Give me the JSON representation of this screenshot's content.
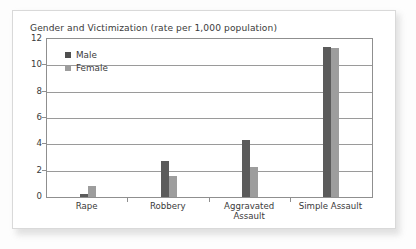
{
  "chart_data": {
    "type": "bar",
    "title": "Gender and Victimization (rate per 1,000 population)",
    "xlabel": "",
    "ylabel": "",
    "ylim": [
      0,
      12
    ],
    "yticks": [
      0,
      2,
      4,
      6,
      8,
      10,
      12
    ],
    "ytick_labels": [
      "0",
      "2",
      "4",
      "6",
      "8",
      "10",
      "12"
    ],
    "grid": true,
    "legend_position": "top-left",
    "categories": [
      "Rape",
      "Robbery",
      "Aggravated Assault",
      "Simple Assault"
    ],
    "category_lines": [
      [
        "Rape"
      ],
      [
        "Robbery"
      ],
      [
        "Aggravated",
        "Assault"
      ],
      [
        "Simple Assault"
      ]
    ],
    "series": [
      {
        "name": "Male",
        "color": "#5b5b5b",
        "values": [
          0.2,
          2.7,
          4.3,
          11.4
        ]
      },
      {
        "name": "Female",
        "color": "#9d9d9d",
        "values": [
          0.8,
          1.6,
          2.3,
          11.3
        ]
      }
    ]
  },
  "legend": {
    "items": [
      {
        "label": "Male",
        "swatch": "male-swatch"
      },
      {
        "label": "Female",
        "swatch": "female-swatch"
      }
    ]
  },
  "colors": {
    "male": "#5b5b5b",
    "female": "#9d9d9d",
    "axis": "#8f8f8f",
    "grid": "#9a9a9a",
    "text": "#3a3a3a",
    "card_background": "#ffffff",
    "page_background": "#fdfdfd"
  }
}
